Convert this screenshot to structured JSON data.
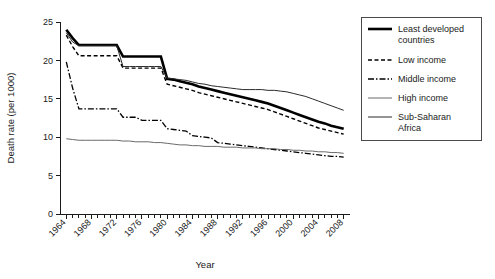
{
  "chart_data": {
    "type": "line",
    "title": "",
    "xlabel": "Year",
    "ylabel": "Death rate (per 1000)",
    "xlim": [
      1963,
      2009
    ],
    "ylim": [
      0,
      25
    ],
    "yticks": [
      0,
      5,
      10,
      15,
      20,
      25
    ],
    "xticks": [
      1964,
      1968,
      1972,
      1976,
      1980,
      1984,
      1988,
      1992,
      1996,
      2000,
      2004,
      2008
    ],
    "xtick_labels": [
      "1964",
      "1968",
      "1972",
      "1976",
      "1980",
      "1984",
      "1988",
      "1992",
      "1996",
      "2000",
      "2004",
      "2008"
    ],
    "ytick_labels": [
      "0",
      "5",
      "10",
      "15",
      "20",
      "25"
    ],
    "x_minor_tick_step": 1,
    "grid": false,
    "legend_position": "right-outside",
    "x": [
      1964,
      1965,
      1966,
      1967,
      1968,
      1969,
      1970,
      1971,
      1972,
      1973,
      1974,
      1975,
      1976,
      1977,
      1978,
      1979,
      1980,
      1981,
      1982,
      1983,
      1984,
      1985,
      1986,
      1987,
      1988,
      1989,
      1990,
      1991,
      1992,
      1993,
      1994,
      1995,
      1996,
      1997,
      1998,
      1999,
      2000,
      2001,
      2002,
      2003,
      2004,
      2005,
      2006,
      2007,
      2008
    ],
    "series": [
      {
        "name": "Least developed countries",
        "style": "solid-thick",
        "color": "#000000",
        "width": 2.6,
        "dash": "",
        "values": [
          24.0,
          22.9,
          22.0,
          22.0,
          22.0,
          22.0,
          22.0,
          22.0,
          22.0,
          20.5,
          20.5,
          20.5,
          20.5,
          20.5,
          20.5,
          20.5,
          17.6,
          17.5,
          17.3,
          17.1,
          16.9,
          16.6,
          16.4,
          16.2,
          16.0,
          15.8,
          15.6,
          15.4,
          15.2,
          15.0,
          14.8,
          14.6,
          14.4,
          14.1,
          13.8,
          13.5,
          13.2,
          12.9,
          12.6,
          12.3,
          12.0,
          11.8,
          11.5,
          11.3,
          11.1
        ]
      },
      {
        "name": "Low income",
        "style": "dashed",
        "color": "#000000",
        "width": 1.4,
        "dash": "4,2.5",
        "values": [
          23.3,
          21.8,
          20.6,
          20.6,
          20.6,
          20.6,
          20.6,
          20.6,
          20.6,
          19.0,
          19.0,
          19.0,
          19.0,
          19.0,
          19.0,
          19.0,
          16.9,
          16.7,
          16.5,
          16.3,
          16.1,
          15.8,
          15.6,
          15.4,
          15.2,
          15.0,
          14.8,
          14.6,
          14.4,
          14.2,
          14.0,
          13.8,
          13.6,
          13.3,
          13.0,
          12.7,
          12.4,
          12.1,
          11.8,
          11.5,
          11.2,
          11.0,
          10.8,
          10.6,
          10.4
        ]
      },
      {
        "name": "Middle income",
        "style": "dash-dot",
        "color": "#000000",
        "width": 1.3,
        "dash": "6,2,1.5,2",
        "values": [
          19.8,
          16.4,
          13.7,
          13.7,
          13.7,
          13.7,
          13.7,
          13.7,
          13.7,
          12.6,
          12.6,
          12.6,
          12.2,
          12.2,
          12.2,
          12.2,
          11.1,
          11.0,
          10.9,
          10.8,
          10.2,
          10.1,
          10.0,
          9.9,
          9.3,
          9.2,
          9.1,
          9.0,
          8.9,
          8.8,
          8.7,
          8.6,
          8.5,
          8.4,
          8.3,
          8.2,
          8.1,
          8.0,
          7.9,
          7.8,
          7.7,
          7.6,
          7.5,
          7.5,
          7.4
        ]
      },
      {
        "name": "High income",
        "style": "solid-thin-gray",
        "color": "#6a6a6a",
        "width": 1.0,
        "dash": "",
        "values": [
          9.8,
          9.7,
          9.6,
          9.6,
          9.6,
          9.6,
          9.6,
          9.6,
          9.6,
          9.5,
          9.5,
          9.4,
          9.4,
          9.4,
          9.3,
          9.3,
          9.2,
          9.1,
          9.0,
          9.0,
          8.9,
          8.9,
          8.8,
          8.8,
          8.8,
          8.7,
          8.7,
          8.7,
          8.6,
          8.6,
          8.6,
          8.5,
          8.5,
          8.5,
          8.4,
          8.4,
          8.3,
          8.3,
          8.2,
          8.2,
          8.1,
          8.1,
          8.0,
          8.0,
          7.9
        ]
      },
      {
        "name": "Sub-Saharan Africa",
        "style": "solid-thin",
        "color": "#2a2a2a",
        "width": 1.0,
        "dash": "",
        "values": [
          23.6,
          22.4,
          21.9,
          21.9,
          21.9,
          21.9,
          21.9,
          21.9,
          21.9,
          19.2,
          19.2,
          19.2,
          19.2,
          19.2,
          19.2,
          19.2,
          17.7,
          17.6,
          17.5,
          17.4,
          17.2,
          17.0,
          16.9,
          16.7,
          16.6,
          16.5,
          16.4,
          16.3,
          16.2,
          16.2,
          16.2,
          16.2,
          16.1,
          16.1,
          16.0,
          15.9,
          15.7,
          15.5,
          15.3,
          15.0,
          14.7,
          14.4,
          14.1,
          13.8,
          13.5
        ]
      }
    ]
  },
  "legend": {
    "entries": [
      {
        "label_line1": "Least developed",
        "label_line2": "countries"
      },
      {
        "label_line1": "Low income",
        "label_line2": ""
      },
      {
        "label_line1": "Middle income",
        "label_line2": ""
      },
      {
        "label_line1": "High income",
        "label_line2": ""
      },
      {
        "label_line1": "Sub-Saharan",
        "label_line2": "Africa"
      }
    ]
  }
}
